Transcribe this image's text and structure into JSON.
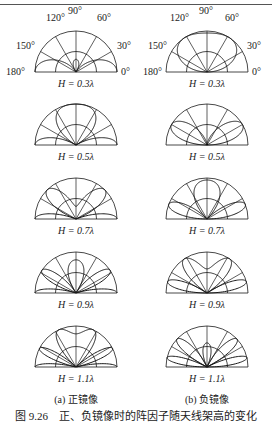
{
  "figure": {
    "caption": "图 9.26　正、负镜像时的阵因子随天线架高的变化",
    "columns": [
      {
        "id": "a",
        "subtitle": "(a) 正镜像"
      },
      {
        "id": "b",
        "subtitle": "(b) 负镜像"
      }
    ],
    "angle_labels": [
      "180°",
      "150°",
      "120°",
      "90°",
      "60°",
      "30°",
      "0°"
    ],
    "rows": [
      {
        "label": "H = 0.3λ",
        "h": 0.3
      },
      {
        "label": "H = 0.5λ",
        "h": 0.5
      },
      {
        "label": "H = 0.7λ",
        "h": 0.7
      },
      {
        "label": "H = 0.9λ",
        "h": 0.9
      },
      {
        "label": "H = 1.1λ",
        "h": 1.1
      }
    ],
    "line_color": "#1a1a1a"
  },
  "chart_data": {
    "type": "polar",
    "angular_grid_deg": [
      0,
      30,
      60,
      90,
      120,
      150,
      180
    ],
    "radial_grid": [
      0.5,
      1.0
    ],
    "heights_lambda": [
      0.3,
      0.5,
      0.7,
      0.9,
      1.1
    ],
    "series": [
      {
        "name": "(a) 正镜像",
        "formula": "|cos(2π H sinθ)|"
      },
      {
        "name": "(b) 负镜像",
        "formula": "|sin(2π H sinθ)|"
      }
    ]
  }
}
